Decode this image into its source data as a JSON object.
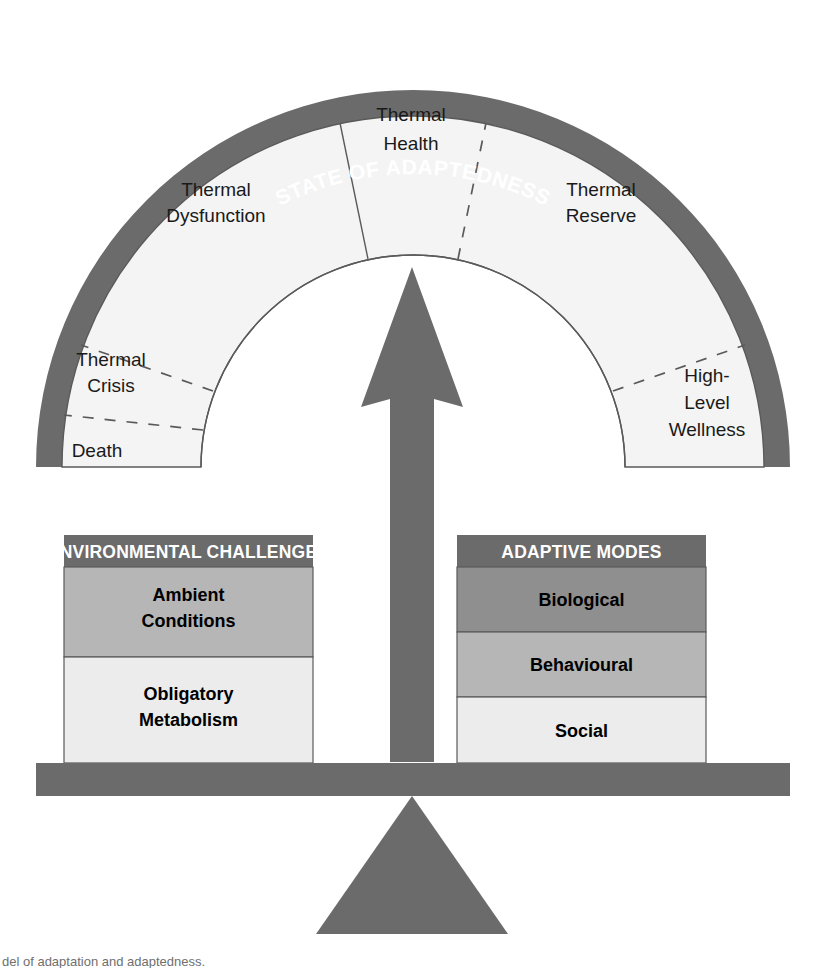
{
  "figure": {
    "title": "STATE OF ADAPTEDNESS",
    "caption": "del of adaptation and adaptedness."
  },
  "colors": {
    "band": "#6b6b6b",
    "beam": "#6b6b6b",
    "arrow": "#6b6b6b",
    "fulcrum": "#6b6b6b",
    "header": "#6b6b6b",
    "tier_dark": "#8f8f8f",
    "tier_medium": "#b6b6b6",
    "tier_light": "#ececec",
    "sector_fill": "#f4f4f4",
    "outline": "#5a5a5a",
    "text_dark": "#1a1a1a",
    "text_light": "#ffffff"
  },
  "gauge": {
    "sectors": [
      {
        "id": "death",
        "label": "Death",
        "lines": [
          "Death"
        ]
      },
      {
        "id": "thermal-crisis",
        "label": "Thermal Crisis",
        "lines": [
          "Thermal",
          "Crisis"
        ]
      },
      {
        "id": "thermal-dysfunction",
        "label": "Thermal Dysfunction",
        "lines": [
          "Thermal",
          "Dysfunction"
        ]
      },
      {
        "id": "thermal-health",
        "label": "Thermal Health",
        "lines": [
          "Thermal",
          "Health"
        ]
      },
      {
        "id": "thermal-reserve",
        "label": "Thermal Reserve",
        "lines": [
          "Thermal",
          "Reserve"
        ]
      },
      {
        "id": "high-level-wellness",
        "label": "High-Level Wellness",
        "lines": [
          "High-",
          "Level",
          "Wellness"
        ]
      }
    ]
  },
  "left_panel": {
    "header": "ENVIRONMENTAL CHALLENGES",
    "tiers": [
      {
        "id": "ambient-conditions",
        "label": "Ambient Conditions",
        "lines": [
          "Ambient",
          "Conditions"
        ],
        "shade": "medium"
      },
      {
        "id": "obligatory-metabolism",
        "label": "Obligatory Metabolism",
        "lines": [
          "Obligatory",
          "Metabolism"
        ],
        "shade": "light"
      }
    ]
  },
  "right_panel": {
    "header": "ADAPTIVE MODES",
    "tiers": [
      {
        "id": "biological",
        "label": "Biological",
        "lines": [
          "Biological"
        ],
        "shade": "dark"
      },
      {
        "id": "behavioural",
        "label": "Behavioural",
        "lines": [
          "Behavioural"
        ],
        "shade": "medium"
      },
      {
        "id": "social",
        "label": "Social",
        "lines": [
          "Social"
        ],
        "shade": "light"
      }
    ]
  },
  "balance": {
    "arrow_name": "upward arrow",
    "beam_name": "balance beam",
    "fulcrum_name": "triangular fulcrum"
  }
}
